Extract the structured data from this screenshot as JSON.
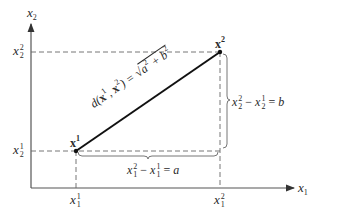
{
  "diagram": {
    "axes": {
      "x_axis_label": "x",
      "x_axis_sub": "1",
      "y_axis_label": "x",
      "y_axis_sub": "2"
    },
    "points": [
      {
        "name": "x",
        "sup": "1"
      },
      {
        "name": "x",
        "sup": "2"
      }
    ],
    "ticks": {
      "x": [
        {
          "var": "x",
          "sub": "1",
          "sup": "1"
        },
        {
          "var": "x",
          "sub": "1",
          "sup": "2"
        }
      ],
      "y": [
        {
          "var": "x",
          "sub": "2",
          "sup": "1"
        },
        {
          "var": "x",
          "sub": "2",
          "sup": "2"
        }
      ]
    },
    "distance_label": {
      "d": "d(",
      "p1": "x",
      "p1_sup": "1",
      "comma": ", ",
      "p2": "x",
      "p2_sup": "2",
      "close": ") = ",
      "sqrt_a": "a",
      "sqrt_a_sup": "2",
      "plus": " + ",
      "sqrt_b": "b",
      "sqrt_b_sup": "2"
    },
    "horizontal_brace": {
      "lhs_var": "x",
      "lhs_sub": "1",
      "lhs_sup": "2",
      "minus": " − ",
      "rhs_var": "x",
      "rhs_sub": "1",
      "rhs_sup": "1",
      "eq": " = ",
      "result": "a"
    },
    "vertical_brace": {
      "lhs_var": "x",
      "lhs_sub": "2",
      "lhs_sup": "2",
      "minus": " − ",
      "rhs_var": "x",
      "rhs_sub": "2",
      "rhs_sup": "1",
      "eq": " = ",
      "result": "b"
    },
    "colors": {
      "line": "#111111",
      "axis": "#444444",
      "dashed": "#555555"
    }
  }
}
